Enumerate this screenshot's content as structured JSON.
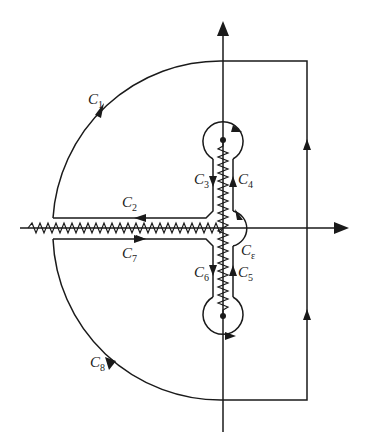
{
  "diagram": {
    "type": "contour-integration-diagram",
    "stroke_color": "#1a1a1a",
    "background": "#ffffff",
    "labels": {
      "c1": {
        "letter": "C",
        "sub": "1"
      },
      "c2": {
        "letter": "C",
        "sub": "2"
      },
      "c3": {
        "letter": "C",
        "sub": "3"
      },
      "c4": {
        "letter": "C",
        "sub": "4"
      },
      "c5": {
        "letter": "C",
        "sub": "5"
      },
      "c6": {
        "letter": "C",
        "sub": "6"
      },
      "c7": {
        "letter": "C",
        "sub": "7"
      },
      "c8": {
        "letter": "C",
        "sub": "8"
      },
      "ce": {
        "letter": "C",
        "sub": "ε"
      }
    },
    "axes": {
      "real_axis": "horizontal",
      "imaginary_axis": "vertical"
    },
    "branch_points": [
      "upper-imaginary-point",
      "lower-imaginary-point"
    ],
    "branch_cuts": [
      "negative-real-axis",
      "imaginary-segment-between-branch-points"
    ]
  }
}
